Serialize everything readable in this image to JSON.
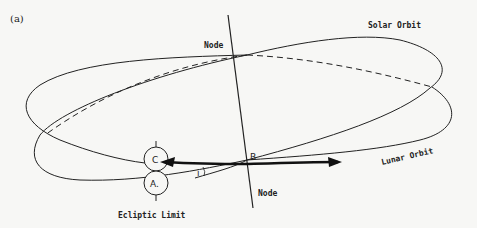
{
  "figure": {
    "panel_label": "(a)",
    "labels": {
      "solar_orbit": "Solar Orbit",
      "lunar_orbit": "Lunar Orbit",
      "node_top": "Node",
      "node_bottom": "Node",
      "ecliptic_limit": "Ecliptic Limit",
      "point_b": "B",
      "point_c": "C",
      "point_a": "A.",
      "angle_i": "i"
    },
    "colors": {
      "ink": "#222222",
      "background": "#f7f7f5"
    }
  }
}
